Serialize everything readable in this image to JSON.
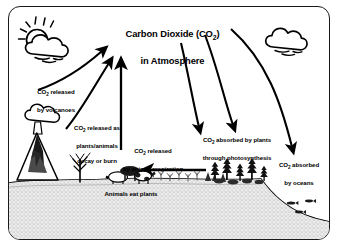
{
  "diagram": {
    "title_line1": "Carbon Dioxide (CO",
    "title_sub": "2",
    "title_line1_end": ")",
    "title_line2": "in Atmosphere",
    "title_full": "Carbon Dioxide (CO2) in Atmosphere"
  },
  "labels": {
    "volcanoes": {
      "line1": "CO",
      "sub": "2",
      "line1_end": " released",
      "line2": "by volcanoes",
      "full": "CO2 released by volcanoes"
    },
    "decay": {
      "line1": "CO",
      "sub": "2",
      "line1_end": " released as",
      "line2": "plants/animals",
      "line3": "decay or burn",
      "full": "CO2 released as plants/animals decay or burn"
    },
    "respiration": {
      "line1": "CO",
      "sub": "2",
      "line1_end": " released",
      "line2": "by animal respiration",
      "full": "CO2 released by animal respiration"
    },
    "photosynthesis": {
      "line1": "CO",
      "sub": "2",
      "line1_end": " absorbed by plants",
      "line2": "through photosynthesis",
      "full": "CO2 absorbed by plants through photosynthesis"
    },
    "oceans": {
      "line1": "CO",
      "sub": "2",
      "line1_end": " absorbed",
      "line2": "by oceans",
      "full": "CO2 absorbed by oceans"
    },
    "animals_eat": {
      "text": "Animals eat plants"
    }
  },
  "icons": {
    "sun": "sun-icon",
    "cloud_left": "cloud-icon",
    "cloud_right": "cloud-icon",
    "volcano": "volcano-icon",
    "tree_bare": "bare-tree-icon",
    "cow": "cow-icon",
    "forest": "forest-icon",
    "fish": "fish-icon",
    "grass": "grass-icon"
  },
  "colors": {
    "ink": "#000000",
    "background": "#ffffff",
    "ground_fill": "#e9e9e9",
    "stipple": "#9a9a9a"
  }
}
